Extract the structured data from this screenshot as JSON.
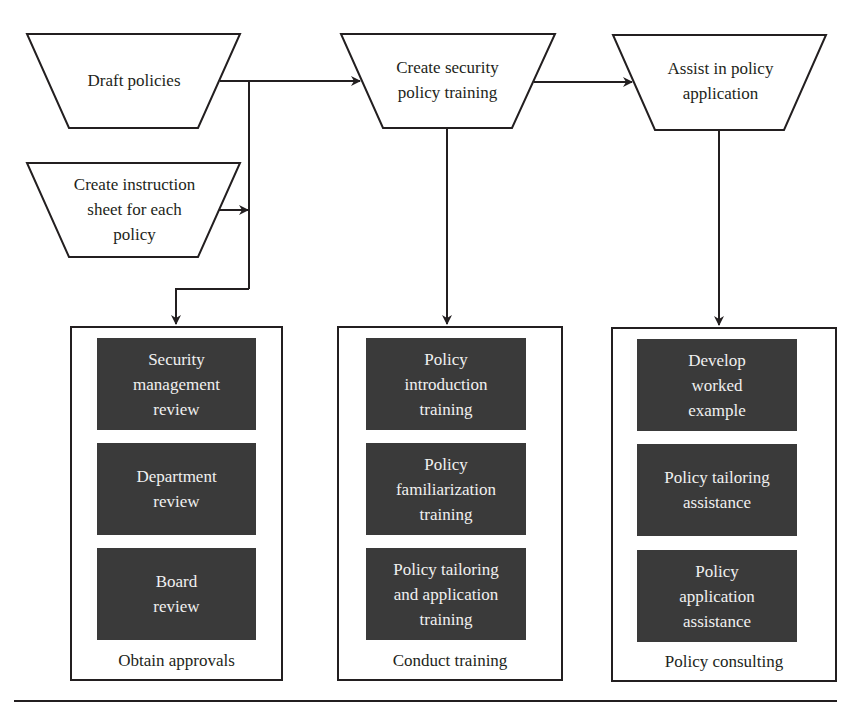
{
  "diagram": {
    "top_steps": [
      {
        "id": "draft",
        "label": "Draft policies"
      },
      {
        "id": "create_training",
        "label": "Create security\npolicy training"
      },
      {
        "id": "assist",
        "label": "Assist in policy\napplication"
      }
    ],
    "side_step": {
      "id": "instruction_sheet",
      "label": "Create instruction\nsheet for each\npolicy"
    },
    "groups": [
      {
        "caption": "Obtain approvals",
        "items": [
          "Security\nmanagement\nreview",
          "Department\nreview",
          "Board\nreview"
        ]
      },
      {
        "caption": "Conduct training",
        "items": [
          "Policy\nintroduction\ntraining",
          "Policy\nfamiliarization\ntraining",
          "Policy tailoring\nand application\ntraining"
        ]
      },
      {
        "caption": "Policy consulting",
        "items": [
          "Develop\nworked\nexample",
          "Policy tailoring\nassistance",
          "Policy\napplication\nassistance"
        ]
      }
    ],
    "colors": {
      "line": "#231f20",
      "dark_box": "#3a3a3a",
      "dark_text": "#f0f0f0",
      "background": "#ffffff"
    }
  }
}
